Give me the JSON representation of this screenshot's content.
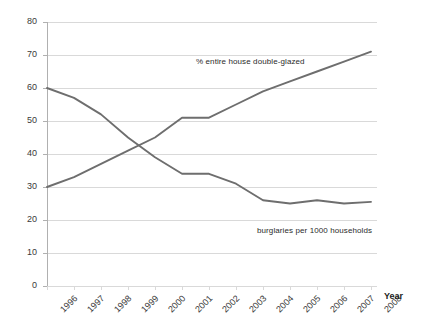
{
  "chart_data": {
    "type": "line",
    "title": "",
    "xlabel": "Year",
    "ylabel": "",
    "xlim": [
      1996,
      2008
    ],
    "ylim": [
      0,
      80
    ],
    "grid": true,
    "legend_position": "inline-annotation",
    "categories": [
      "1996",
      "1997",
      "1998",
      "1999",
      "2000",
      "2001",
      "2002",
      "2003",
      "2004",
      "2005",
      "2006",
      "2007",
      "2008"
    ],
    "ytick_labels": [
      "0",
      "10",
      "20",
      "30",
      "40",
      "50",
      "60",
      "70",
      "80"
    ],
    "ytick_values": [
      0,
      10,
      20,
      30,
      40,
      50,
      60,
      70,
      80
    ],
    "series": [
      {
        "name": "% entire house double-glazed",
        "color": "#6e6e6e",
        "values": [
          30,
          33,
          37,
          41,
          45,
          51,
          51,
          55,
          59,
          62,
          65,
          68,
          71
        ]
      },
      {
        "name": "burglaries per 1000 households",
        "color": "#6e6e6e",
        "values": [
          60,
          57,
          52,
          45,
          39,
          34,
          34,
          31,
          26,
          25,
          26,
          25,
          25.5
        ]
      }
    ],
    "annotations": [
      {
        "text": "% entire house double-glazed",
        "series": 0
      },
      {
        "text": "burglaries per 1000 households",
        "series": 1
      }
    ]
  },
  "axis": {
    "x_title": "Year"
  },
  "colors": {
    "line": "#6e6e6e",
    "grid": "#d9d9d9",
    "axis": "#b0b0b0",
    "text": "#3a3a3a"
  }
}
